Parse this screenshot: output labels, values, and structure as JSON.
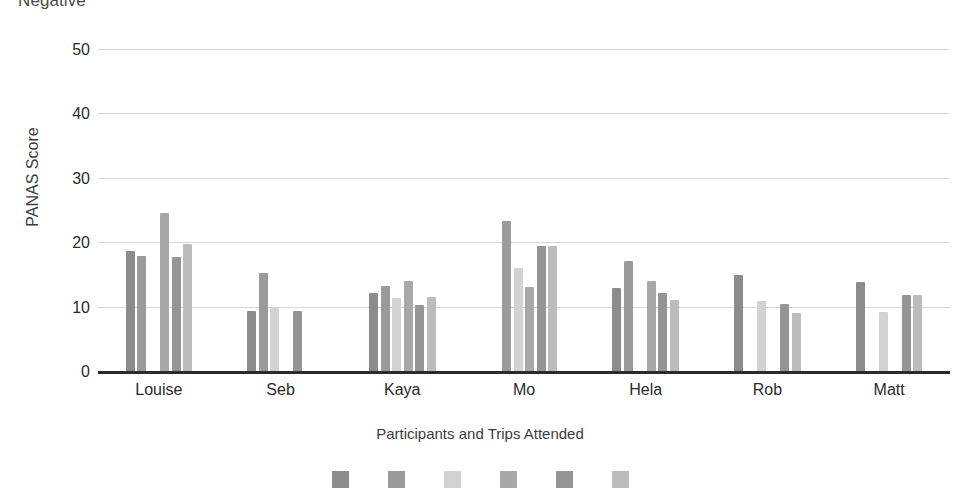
{
  "chart": {
    "title": "Negative",
    "y_axis_label": "PANAS Score",
    "x_axis_label": "Participants and Trips Attended"
  },
  "chart_data": {
    "type": "bar",
    "title": "Negative",
    "xlabel": "Participants and Trips Attended",
    "ylabel": "PANAS Score",
    "ylim": [
      0,
      52
    ],
    "yticks": [
      0,
      10,
      20,
      30,
      40,
      50
    ],
    "grid": true,
    "legend_position": "bottom",
    "categories": [
      "Louise",
      "Seb",
      "Kaya",
      "Mo",
      "Hela",
      "Rob",
      "Matt"
    ],
    "series": [
      {
        "name": "Trip 1",
        "color": "#8c8c8c",
        "values": [
          18.8,
          9.4,
          12.3,
          null,
          13.1,
          15.0,
          14.0
        ]
      },
      {
        "name": "Trip 2",
        "color": "#9a9a9a",
        "values": [
          18.0,
          15.3,
          13.3,
          23.5,
          17.3,
          null,
          null
        ]
      },
      {
        "name": "Trip 3",
        "color": "#d2d2d2",
        "values": [
          null,
          9.9,
          11.5,
          16.2,
          null,
          11.1,
          9.3
        ]
      },
      {
        "name": "Trip 4",
        "color": "#a8a8a8",
        "values": [
          24.7,
          null,
          14.2,
          13.2,
          14.1,
          null,
          null
        ]
      },
      {
        "name": "Trip 5",
        "color": "#959595",
        "values": [
          17.8,
          9.5,
          10.4,
          19.5,
          12.3,
          10.5,
          12.0
        ]
      },
      {
        "name": "Trip 6",
        "color": "#bcbcbc",
        "values": [
          19.8,
          null,
          11.6,
          19.6,
          11.2,
          9.2,
          12.0
        ]
      }
    ]
  }
}
